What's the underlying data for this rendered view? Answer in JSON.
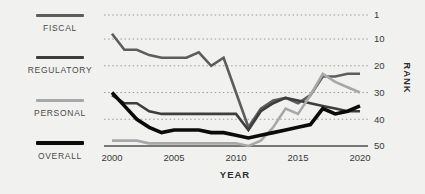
{
  "colors": {
    "background": "#f1f1ef",
    "grid_dotted": "#9c9c9c",
    "axis_line": "#4f4f4f",
    "fiscal": "#5c5d5f",
    "regulatory": "#3d3d3d",
    "personal": "#a6a8aa",
    "overall": "#0b0b0b"
  },
  "legend": {
    "items": [
      {
        "id": "fiscal",
        "label": "FISCAL"
      },
      {
        "id": "regulatory",
        "label": "REGULATORY"
      },
      {
        "id": "personal",
        "label": "PERSONAL"
      },
      {
        "id": "overall",
        "label": "OVERALL"
      }
    ]
  },
  "chart_data": {
    "type": "line",
    "title": "",
    "xlabel": "YEAR",
    "ylabel": "RANK",
    "x": [
      2000,
      2001,
      2002,
      2003,
      2004,
      2005,
      2006,
      2007,
      2008,
      2009,
      2010,
      2011,
      2012,
      2013,
      2014,
      2015,
      2016,
      2017,
      2018,
      2019,
      2020
    ],
    "series": [
      {
        "name": "FISCAL",
        "color_key": "fiscal",
        "width": 2.6,
        "values": [
          8,
          14,
          14,
          16,
          17,
          17,
          17,
          15,
          20,
          17,
          30,
          43,
          36,
          33,
          32,
          34,
          31,
          24,
          24,
          23,
          23
        ]
      },
      {
        "name": "REGULATORY",
        "color_key": "regulatory",
        "width": 2.6,
        "values": [
          31,
          34,
          34,
          37,
          38,
          38,
          38,
          38,
          38,
          38,
          38,
          44,
          37,
          34,
          32,
          33,
          34,
          35,
          36,
          37,
          37
        ]
      },
      {
        "name": "PERSONAL",
        "color_key": "personal",
        "width": 2.6,
        "values": [
          48,
          48,
          48,
          49,
          49,
          49,
          49,
          49,
          49,
          49,
          49,
          50,
          48,
          43,
          36,
          38,
          31,
          23,
          26,
          28,
          30
        ]
      },
      {
        "name": "OVERALL",
        "color_key": "overall",
        "width": 3.6,
        "values": [
          30,
          35,
          40,
          43,
          45,
          44,
          44,
          44,
          45,
          45,
          46,
          47,
          46,
          45,
          44,
          43,
          42,
          36,
          38,
          37,
          35
        ]
      }
    ],
    "y_ticks": [
      1,
      10,
      20,
      30,
      40,
      50
    ],
    "x_ticks": [
      2000,
      2005,
      2010,
      2015,
      2020
    ],
    "ylim": [
      1,
      50
    ],
    "y_inverted": true,
    "grid": "horizontal-dotted",
    "legend_position": "left",
    "y_axis_side": "right"
  }
}
